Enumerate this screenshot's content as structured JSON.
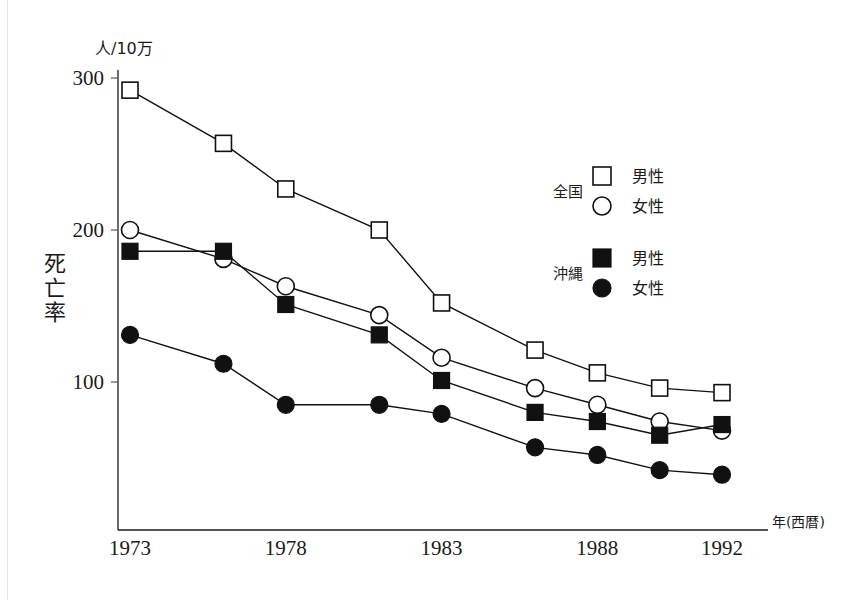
{
  "chart_data": {
    "type": "line",
    "title": "",
    "unit_label": "人/10万",
    "ylabel": "死亡率",
    "xlabel": "年(西暦)",
    "x": [
      1973,
      1976,
      1978,
      1981,
      1983,
      1986,
      1988,
      1990,
      1992
    ],
    "xtick_labels": [
      "1973",
      "1978",
      "1983",
      "1988",
      "1992"
    ],
    "xtick_values": [
      1973,
      1978,
      1983,
      1988,
      1992
    ],
    "ytick_labels": [
      "100",
      "200",
      "300"
    ],
    "ytick_values": [
      100,
      200,
      300
    ],
    "xlim": [
      1973,
      1992
    ],
    "ylim": [
      0,
      300
    ],
    "grid": false,
    "legend_position": "right",
    "legend_groups": [
      {
        "group_label": "全国",
        "entries": [
          {
            "label": "男性",
            "marker": "open-square",
            "series": "national_male"
          },
          {
            "label": "女性",
            "marker": "open-circle",
            "series": "national_female"
          }
        ]
      },
      {
        "group_label": "沖縄",
        "entries": [
          {
            "label": "男性",
            "marker": "filled-square",
            "series": "okinawa_male"
          },
          {
            "label": "女性",
            "marker": "filled-circle",
            "series": "okinawa_female"
          }
        ]
      }
    ],
    "series": [
      {
        "name": "national_male",
        "group": "全国",
        "sex": "男性",
        "marker": "open-square",
        "values": [
          292,
          257,
          227,
          200,
          152,
          121,
          106,
          96,
          93
        ]
      },
      {
        "name": "national_female",
        "group": "全国",
        "sex": "女性",
        "marker": "open-circle",
        "values": [
          200,
          181,
          163,
          144,
          116,
          96,
          85,
          74,
          68
        ]
      },
      {
        "name": "okinawa_male",
        "group": "沖縄",
        "sex": "男性",
        "marker": "filled-square",
        "values": [
          186,
          186,
          151,
          131,
          101,
          80,
          74,
          65,
          72
        ]
      },
      {
        "name": "okinawa_female",
        "group": "沖縄",
        "sex": "女性",
        "marker": "filled-circle",
        "values": [
          131,
          112,
          85,
          85,
          79,
          57,
          52,
          42,
          39
        ]
      }
    ],
    "colors": {
      "line": "#111111",
      "marker_fill_open": "#ffffff",
      "marker_fill_solid": "#111111",
      "axis": "#1a1a1a",
      "background": "#ffffff"
    }
  }
}
